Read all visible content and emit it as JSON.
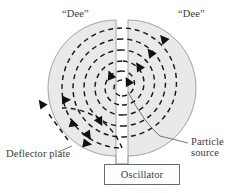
{
  "figure": {
    "width": 246,
    "height": 193,
    "background_color": "#ffffff"
  },
  "labels": {
    "dee_left": "“Dee”",
    "dee_right": "“Dee”",
    "deflector_plate": "Deflector plate",
    "particle_source_line1": "Particle",
    "particle_source_line2": "source",
    "oscillator": "Oscillator"
  },
  "colors": {
    "dee_fill": "#e9e9e9",
    "dee_stroke": "#9a9a9a",
    "spiral_stroke": "#1a1a1a",
    "text": "#3b3b3b",
    "box_stroke": "#6b6b6b",
    "leader_stroke": "#555555"
  },
  "geometry": {
    "center_x": 122,
    "center_y": 88,
    "radius": 68,
    "gap_left_x": 116,
    "gap_right_x": 128,
    "spiral_radii": [
      8,
      17,
      27,
      38,
      49,
      60
    ],
    "dash_pattern": "5 4"
  },
  "parts": {
    "dee_left": "dee-left-plate",
    "dee_right": "dee-right-plate",
    "particle_path": "dashed-spiral-trajectory",
    "exit_beam": "deflected-exit-beam",
    "oscillator_connectors": 2
  }
}
